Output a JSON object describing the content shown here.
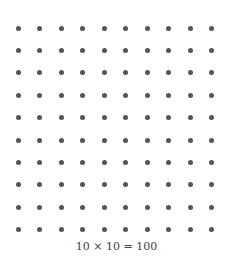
{
  "diagram": {
    "rows": 10,
    "cols": 10,
    "dot_color": "#555555",
    "origin": {
      "x": 18,
      "y": 28
    },
    "spacing": {
      "x": 21.55,
      "y": 22.4
    }
  },
  "caption": "10 × 10 = 100"
}
